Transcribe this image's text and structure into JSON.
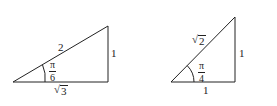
{
  "diagram": {
    "triangles": [
      {
        "id": "30-60-90",
        "hypotenuse": "2",
        "opposite": "1",
        "adjacent_radicand": "3",
        "angle": {
          "numerator": "π",
          "denominator": "6"
        }
      },
      {
        "id": "45-45-90",
        "hypotenuse_radicand": "2",
        "opposite": "1",
        "adjacent": "1",
        "angle": {
          "numerator": "π",
          "denominator": "4"
        }
      }
    ],
    "sqrt_symbol": "√",
    "stroke_color": "#222222"
  }
}
